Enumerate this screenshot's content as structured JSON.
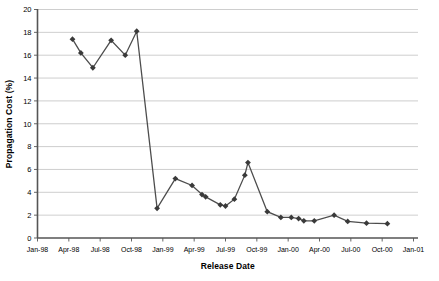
{
  "chart_data": {
    "type": "line",
    "title": "",
    "xlabel": "Release Date",
    "ylabel": "Propagation Cost (%)",
    "xlim": [
      "Jan-98",
      "Jan-01"
    ],
    "ylim": [
      0,
      20
    ],
    "ytick_labels": [
      "0",
      "2",
      "4",
      "6",
      "8",
      "10",
      "12",
      "14",
      "16",
      "18",
      "20"
    ],
    "ytick_values": [
      0,
      2,
      4,
      6,
      8,
      10,
      12,
      14,
      16,
      18,
      20
    ],
    "xtick_labels": [
      "Jan-98",
      "Apr-98",
      "Jul-98",
      "Oct-98",
      "Jan-99",
      "Apr-99",
      "Jul-99",
      "Oct-99",
      "Jan-00",
      "Apr-00",
      "Jul-00",
      "Oct-00",
      "Jan-01"
    ],
    "xtick_months": [
      0,
      3,
      6,
      9,
      12,
      15,
      18,
      21,
      24,
      27,
      30,
      33,
      36
    ],
    "grid": "horizontal",
    "legend": "none",
    "marker": "diamond",
    "series": [
      {
        "name": "Propagation Cost",
        "x_months": [
          3.35,
          4.15,
          5.3,
          7.05,
          8.4,
          9.5,
          11.45,
          13.2,
          14.8,
          15.75,
          16.1,
          17.5,
          18.0,
          18.85,
          19.85,
          20.15,
          22.0,
          23.3,
          24.3,
          25.0,
          25.5,
          26.5,
          28.4,
          29.7,
          31.5,
          33.5
        ],
        "x_labels": [
          "Apr-98",
          "May-98",
          "Jun-98",
          "Aug-98",
          "Sep-98",
          "Oct-98",
          "Dec-98",
          "Feb-99",
          "Mar-99",
          "Apr-99",
          "May-99",
          "Jun-99",
          "Jul-99",
          "Jul-99",
          "Aug-99",
          "Aug-99",
          "Oct-99",
          "Dec-99",
          "Jan-00",
          "Feb-00",
          "Feb-00",
          "Mar-00",
          "May-00",
          "Jun-00",
          "Aug-00",
          "Oct-00"
        ],
        "values": [
          17.4,
          16.2,
          14.9,
          17.3,
          16.0,
          18.1,
          2.6,
          5.2,
          4.6,
          3.8,
          3.6,
          2.9,
          2.8,
          3.4,
          5.5,
          6.6,
          2.3,
          1.8,
          1.8,
          1.7,
          1.5,
          1.5,
          2.0,
          1.45,
          1.3,
          1.25
        ]
      }
    ],
    "colors": {
      "line": "#4d4d4d",
      "marker": "#3a3a3a",
      "grid": "#b9b9b9",
      "axis": "#555555",
      "background": "#ffffff"
    }
  }
}
